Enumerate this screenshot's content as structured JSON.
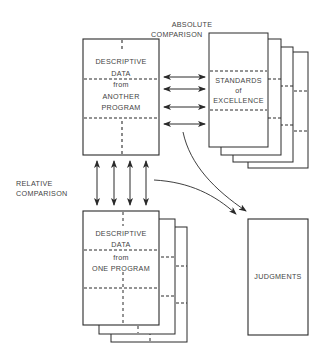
{
  "labels": {
    "absolute_comparison": [
      "ABSOLUTE",
      "COMPARISON"
    ],
    "relative_comparison": [
      "RELATIVE",
      "COMPARISON"
    ]
  },
  "boxes": {
    "another_program": [
      "DESCRIPTIVE",
      "DATA",
      "from",
      "ANOTHER",
      "PROGRAM"
    ],
    "standards": [
      "STANDARDS",
      "of",
      "EXCELLENCE"
    ],
    "one_program": [
      "DESCRIPTIVE",
      "DATA",
      "from",
      "ONE PROGRAM"
    ],
    "judgments": "JUDGMENTS"
  },
  "colors": {
    "line": "#2a2a2a",
    "text": "#444444",
    "background": "#ffffff"
  }
}
